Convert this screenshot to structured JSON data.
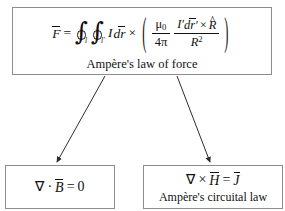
{
  "diagram": {
    "type": "flowchart",
    "title_node": {
      "id": "ampere-law-of-force",
      "caption": "Ampère's law of force",
      "formula_plain": "F̄ = ∮_l ∮_l' I dr̄ × ( μ0/4π · I' dr̄' × R̂ / R² )",
      "formula": {
        "lhs_symbol": "F",
        "equals": "=",
        "integral_1_subscript": "l",
        "integral_2_subscript": "l'",
        "current": "I",
        "differential": "dr",
        "cross_1": "×",
        "paren_open": "(",
        "paren_close": ")",
        "frac1_num_base": "μ",
        "frac1_num_sub": "0",
        "frac1_den_coeff": "4",
        "frac1_den_symbol": "π",
        "frac2_num_current": "I",
        "frac2_num_prime": "′",
        "frac2_num_diff": "dr",
        "frac2_num_diff_prime": "′",
        "frac2_num_cross": "×",
        "frac2_num_unit": "R",
        "frac2_den_base": "R",
        "frac2_den_exp": "2"
      }
    },
    "children": [
      {
        "id": "gauss-law-magnetism",
        "caption": "",
        "formula_plain": "∇ · B̄ = 0",
        "formula": {
          "nabla": "∇",
          "operator": "·",
          "field": "B",
          "equals": "=",
          "rhs": "0"
        }
      },
      {
        "id": "ampere-circuital-law",
        "caption": "Ampère's circuital law",
        "formula_plain": "∇ × H̄ = J̄",
        "formula": {
          "nabla": "∇",
          "operator": "×",
          "field": "H",
          "equals": "=",
          "rhs": "J"
        }
      }
    ],
    "connectors": [
      {
        "id": "arrow-to-gauss",
        "from": "ampere-law-of-force",
        "to": "gauss-law-magnetism",
        "style": "solid-arrow"
      },
      {
        "id": "arrow-to-circuital",
        "from": "ampere-law-of-force",
        "to": "ampere-circuital-law",
        "style": "solid-arrow"
      }
    ],
    "colors": {
      "border": "#8d8d8d",
      "text": "#111111",
      "background": "#ffffff",
      "connector": "#3a3a3a"
    }
  }
}
